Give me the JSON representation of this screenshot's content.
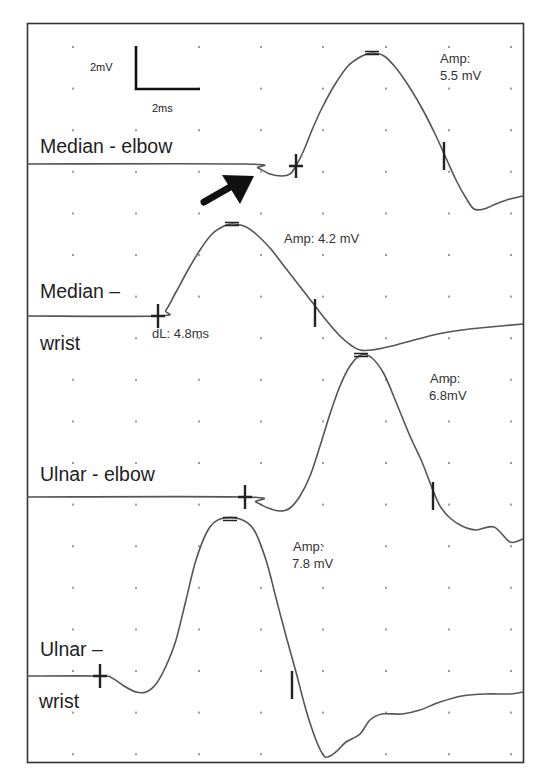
{
  "figure": {
    "frame": {
      "x": 27,
      "y": 23,
      "width": 497,
      "height": 740
    },
    "grid": {
      "dot_x": [
        73,
        136,
        199,
        261,
        323,
        386,
        449,
        511
      ],
      "dot_y_start": 47,
      "dot_y_step": 41.6,
      "dot_y_count": 18,
      "dot_color": "#9a9a9a"
    },
    "trace_color": "#555555",
    "marker_color": "#222222",
    "scale_bar": {
      "vertical_label": "2mV",
      "horizontal_label": "2ms"
    }
  },
  "chart_data": {
    "type": "line",
    "xlabel": "Time (scale bar 2 ms)",
    "ylabel": "Amplitude (scale bar 2 mV)",
    "grid": true,
    "series": [
      {
        "name": "Median - elbow",
        "label_lines": [
          "Median - elbow"
        ],
        "amplitude_text": [
          "Amp:",
          "5.5 mV"
        ],
        "amplitude_mV": 5.5,
        "points": [
          [
            27,
            164
          ],
          [
            245,
            164
          ],
          [
            258,
            168
          ],
          [
            270,
            174
          ],
          [
            282,
            176
          ],
          [
            290,
            174
          ],
          [
            296,
            166
          ],
          [
            304,
            150
          ],
          [
            312,
            130
          ],
          [
            322,
            108
          ],
          [
            334,
            86
          ],
          [
            348,
            66
          ],
          [
            362,
            56
          ],
          [
            372,
            53
          ],
          [
            384,
            56
          ],
          [
            396,
            68
          ],
          [
            410,
            88
          ],
          [
            424,
            112
          ],
          [
            436,
            136
          ],
          [
            446,
            158
          ],
          [
            456,
            180
          ],
          [
            466,
            198
          ],
          [
            474,
            209
          ],
          [
            484,
            209
          ],
          [
            496,
            204
          ],
          [
            510,
            199
          ],
          [
            523,
            196
          ]
        ],
        "markers": {
          "onset": [
            296,
            166
          ],
          "peak": [
            372,
            53
          ],
          "end": [
            444,
            156
          ]
        }
      },
      {
        "name": "Median - wrist",
        "label_lines": [
          "Median –",
          "wrist"
        ],
        "amplitude_text": [
          "Amp: 4.2 mV"
        ],
        "amplitude_mV": 4.2,
        "latency_text": "dL: 4.8ms",
        "latency_ms": 4.8,
        "points": [
          [
            27,
            316
          ],
          [
            158,
            316
          ],
          [
            166,
            310
          ],
          [
            176,
            292
          ],
          [
            188,
            270
          ],
          [
            200,
            250
          ],
          [
            212,
            234
          ],
          [
            224,
            226
          ],
          [
            232,
            224
          ],
          [
            244,
            226
          ],
          [
            256,
            234
          ],
          [
            270,
            248
          ],
          [
            284,
            266
          ],
          [
            298,
            284
          ],
          [
            312,
            302
          ],
          [
            326,
            320
          ],
          [
            340,
            336
          ],
          [
            352,
            346
          ],
          [
            360,
            350
          ],
          [
            372,
            350
          ],
          [
            392,
            346
          ],
          [
            414,
            340
          ],
          [
            438,
            334
          ],
          [
            462,
            330
          ],
          [
            490,
            327
          ],
          [
            523,
            324
          ]
        ],
        "markers": {
          "onset": [
            158,
            316
          ],
          "peak": [
            232,
            224
          ],
          "end": [
            315,
            313
          ]
        }
      },
      {
        "name": "Ulnar - elbow",
        "label_lines": [
          "Ulnar - elbow"
        ],
        "amplitude_text": [
          "Amp:",
          "6.8mV"
        ],
        "amplitude_mV": 6.8,
        "points": [
          [
            27,
            497
          ],
          [
            245,
            497
          ],
          [
            256,
            502
          ],
          [
            268,
            508
          ],
          [
            280,
            511
          ],
          [
            290,
            508
          ],
          [
            300,
            496
          ],
          [
            310,
            476
          ],
          [
            320,
            446
          ],
          [
            330,
            414
          ],
          [
            340,
            386
          ],
          [
            350,
            366
          ],
          [
            361,
            355
          ],
          [
            372,
            358
          ],
          [
            384,
            374
          ],
          [
            396,
            402
          ],
          [
            410,
            436
          ],
          [
            422,
            462
          ],
          [
            432,
            488
          ],
          [
            440,
            506
          ],
          [
            450,
            518
          ],
          [
            462,
            526
          ],
          [
            476,
            530
          ],
          [
            494,
            527
          ],
          [
            510,
            542
          ],
          [
            523,
            539
          ]
        ],
        "markers": {
          "onset": [
            245,
            497
          ],
          "peak": [
            361,
            355
          ],
          "end": [
            433,
            496
          ]
        }
      },
      {
        "name": "Ulnar - wrist",
        "label_lines": [
          "Ulnar –",
          "wrist"
        ],
        "amplitude_text": [
          "Amp:",
          "7.8 mV"
        ],
        "amplitude_mV": 7.8,
        "points": [
          [
            27,
            676
          ],
          [
            100,
            676
          ],
          [
            112,
            678
          ],
          [
            124,
            686
          ],
          [
            136,
            692
          ],
          [
            146,
            692
          ],
          [
            156,
            684
          ],
          [
            166,
            666
          ],
          [
            176,
            640
          ],
          [
            186,
            600
          ],
          [
            196,
            560
          ],
          [
            208,
            530
          ],
          [
            220,
            519
          ],
          [
            240,
            519
          ],
          [
            254,
            530
          ],
          [
            266,
            560
          ],
          [
            276,
            598
          ],
          [
            286,
            636
          ],
          [
            296,
            672
          ],
          [
            306,
            710
          ],
          [
            316,
            740
          ],
          [
            324,
            756
          ],
          [
            330,
            756
          ],
          [
            338,
            750
          ],
          [
            346,
            742
          ],
          [
            360,
            734
          ],
          [
            370,
            720
          ],
          [
            382,
            714
          ],
          [
            402,
            714
          ],
          [
            420,
            710
          ],
          [
            440,
            702
          ],
          [
            462,
            696
          ],
          [
            486,
            694
          ],
          [
            510,
            694
          ],
          [
            523,
            692
          ]
        ],
        "markers": {
          "onset": [
            100,
            676
          ],
          "peak": [
            230,
            519
          ],
          "end": [
            292,
            685
          ]
        }
      }
    ]
  },
  "labels": {
    "scale_v": "2mV",
    "scale_h": "2ms",
    "median_elbow": "Median - elbow",
    "median_wrist_1": "Median –",
    "median_wrist_2": "wrist",
    "ulnar_elbow": "Ulnar - elbow",
    "ulnar_wrist_1": "Ulnar –",
    "ulnar_wrist_2": "wrist",
    "amp_me_1": "Amp:",
    "amp_me_2": "5.5 mV",
    "amp_mw": "Amp: 4.2 mV",
    "dl_mw": "dL: 4.8ms",
    "amp_ue_1": "Amp:",
    "amp_ue_2": "6.8mV",
    "amp_uw_1": "Amp:",
    "amp_uw_2": "7.8 mV"
  },
  "annotation": {
    "arrow": "pointer-arrow",
    "arrow_color": "#111111"
  }
}
